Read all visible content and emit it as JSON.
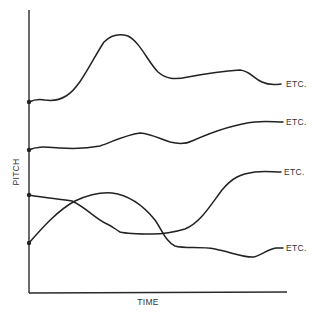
{
  "diagram": {
    "x_axis_label": "TIME",
    "y_axis_label": "PITCH",
    "curves": [
      {
        "id": "contour-1",
        "end_label": "ETC.",
        "description": "starts mid-high, rises to a high peak, falls, plateaus, then falls slightly"
      },
      {
        "id": "contour-2",
        "end_label": "ETC.",
        "description": "starts mid, nearly flat with gentle rise and dip, then rises gradually"
      },
      {
        "id": "contour-3",
        "end_label": "ETC.",
        "description": "starts lower-mid, gently falls to a low plateau, then rises sharply"
      },
      {
        "id": "contour-4",
        "end_label": "ETC.",
        "description": "starts low, rises to a hump, then falls steeply to a low level"
      }
    ]
  },
  "colors": {
    "line": "#222222",
    "background": "#ffffff"
  }
}
